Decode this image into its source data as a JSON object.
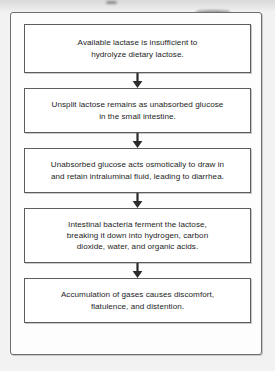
{
  "diagram": {
    "orientation": "vertical-top-to-bottom",
    "accent_color": "#5c5c5c",
    "background_color": "#ffffff",
    "frame_color": "#6e6e6e",
    "text_color": "#1d1d1d",
    "nodes": [
      {
        "id": "node-1",
        "text": "Available lactase is insufficient to\nhydrolyze dietary lactose."
      },
      {
        "id": "node-2",
        "text": "Unsplit lactose remains as unabsorbed glucose\nin the small intestine."
      },
      {
        "id": "node-3",
        "text": "Unabsorbed glucose acts osmotically to draw in\nand retain intraluminal fluid, leading to diarrhea."
      },
      {
        "id": "node-4",
        "text": "Intestinal bacteria ferment the lactose,\nbreaking it down into hydrogen, carbon\ndioxide, water, and organic acids."
      },
      {
        "id": "node-5",
        "text": "Accumulation of gases causes discomfort,\nflatulence, and distention."
      }
    ],
    "connectors": [
      {
        "id": "arrow-1",
        "from": "node-1",
        "to": "node-2",
        "icon": "arrow-down-icon"
      },
      {
        "id": "arrow-2",
        "from": "node-2",
        "to": "node-3",
        "icon": "arrow-down-icon"
      },
      {
        "id": "arrow-3",
        "from": "node-3",
        "to": "node-4",
        "icon": "arrow-down-icon"
      },
      {
        "id": "arrow-4",
        "from": "node-4",
        "to": "node-5",
        "icon": "arrow-down-icon"
      }
    ]
  }
}
